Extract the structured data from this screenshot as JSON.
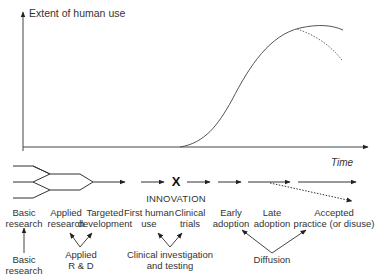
{
  "axes": {
    "y_label": "Extent of human use",
    "x_label": "Time"
  },
  "innovation": {
    "marker": "X",
    "label": "INNOVATION"
  },
  "stages": [
    {
      "line1": "Basic",
      "line2": "research"
    },
    {
      "line1": "Applied",
      "line2": "research"
    },
    {
      "line1": "Targeted",
      "line2": "development"
    },
    {
      "line1": "First human",
      "line2": "use"
    },
    {
      "line1": "Clinical",
      "line2": "trials"
    },
    {
      "line1": "Early",
      "line2": "adoption"
    },
    {
      "line1": "Late",
      "line2": "adoption"
    },
    {
      "line1": "Accepted",
      "line2": "practice (or disuse)"
    }
  ],
  "groups": [
    {
      "line1": "Basic",
      "line2": "research"
    },
    {
      "line1": "Applied",
      "line2": "R & D"
    },
    {
      "line1": "Clinical investigation",
      "line2": "and testing"
    },
    {
      "line1": "Diffusion",
      "line2": ""
    }
  ],
  "colors": {
    "line": "#333333",
    "curve": "#555555",
    "background": "#ffffff"
  }
}
